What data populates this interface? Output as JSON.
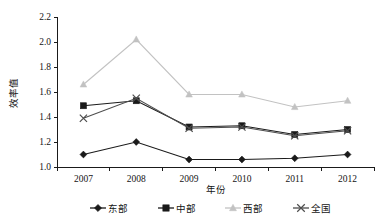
{
  "chart_data": {
    "type": "line",
    "title": "",
    "xlabel": "年份",
    "ylabel": "效率值",
    "categories": [
      "2007",
      "2008",
      "2009",
      "2010",
      "2011",
      "2012"
    ],
    "ylim": [
      1.0,
      2.2
    ],
    "ytick_step": 0.2,
    "yticks": [
      "1.0",
      "1.2",
      "1.4",
      "1.6",
      "1.8",
      "2.0",
      "2.2"
    ],
    "ytick_values": [
      1.0,
      1.2,
      1.4,
      1.6,
      1.8,
      2.0,
      2.2
    ],
    "grid": false,
    "legend_position": "bottom",
    "series": [
      {
        "name": "东部",
        "marker": "diamond",
        "color": "#1a1a1a",
        "values": [
          1.1,
          1.2,
          1.06,
          1.06,
          1.07,
          1.1
        ]
      },
      {
        "name": "中部",
        "marker": "square",
        "color": "#1a1a1a",
        "values": [
          1.49,
          1.53,
          1.32,
          1.33,
          1.26,
          1.3
        ]
      },
      {
        "name": "西部",
        "marker": "triangle",
        "color": "#c2c2c2",
        "values": [
          1.66,
          2.02,
          1.58,
          1.58,
          1.48,
          1.53
        ]
      },
      {
        "name": "全国",
        "marker": "cross",
        "color": "#4d4d4d",
        "values": [
          1.39,
          1.55,
          1.31,
          1.32,
          1.25,
          1.29
        ]
      }
    ]
  },
  "axis": {
    "y_title": "效率值",
    "x_title": "年份"
  },
  "colors": {
    "axis": "#1a1a1a",
    "background": "#ffffff",
    "series_dongbu": "#1a1a1a",
    "series_zhongbu": "#1a1a1a",
    "series_xibu": "#c2c2c2",
    "series_quanguo": "#4d4d4d"
  }
}
